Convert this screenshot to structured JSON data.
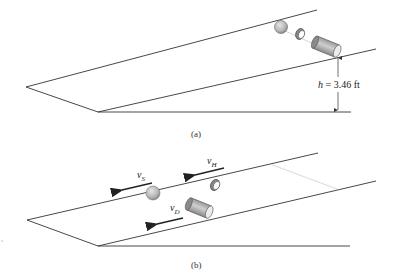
{
  "panel_a": {
    "caption": "(a)",
    "height_label": {
      "var": "h",
      "text": " = 3.46 ft"
    },
    "objects": [
      "sphere",
      "hoop",
      "cylinder"
    ]
  },
  "panel_b": {
    "caption": "(b)",
    "labels": {
      "vS": {
        "v": "v",
        "sub": "S"
      },
      "vH": {
        "v": "v",
        "sub": "H"
      },
      "vD": {
        "v": "v",
        "sub": "D"
      }
    },
    "objects": [
      "sphere",
      "hoop",
      "cylinder"
    ]
  },
  "colors": {
    "line": "#333333",
    "object_fill": "#bdbdbd",
    "object_dark": "#6e6e6e",
    "guide": "#c8c8c8"
  }
}
